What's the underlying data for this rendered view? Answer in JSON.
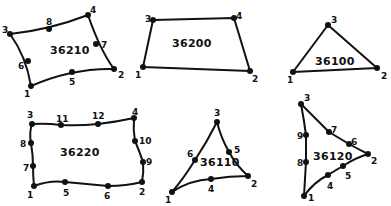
{
  "diagram": {
    "title": "",
    "elements": [
      {
        "id": "36210",
        "label": "36210",
        "shape": "quadrilateral-8-node",
        "label_pos": [
          50,
          54
        ],
        "path": "M31,86 Q72,68 114,69 Q100,50 88,15 Q49,30 10,34 Q26,56 31,86 Z",
        "nodes": [
          {
            "n": "1",
            "x": 31,
            "y": 86,
            "lx": 24,
            "ly": 97
          },
          {
            "n": "2",
            "x": 114,
            "y": 69,
            "lx": 118,
            "ly": 78
          },
          {
            "n": "3",
            "x": 10,
            "y": 34,
            "lx": 2,
            "ly": 33
          },
          {
            "n": "4",
            "x": 88,
            "y": 15,
            "lx": 90,
            "ly": 13
          },
          {
            "n": "5",
            "x": 72,
            "y": 72,
            "lx": 69,
            "ly": 85
          },
          {
            "n": "6",
            "x": 28,
            "y": 61,
            "lx": 18,
            "ly": 69
          },
          {
            "n": "7",
            "x": 96,
            "y": 44,
            "lx": 101,
            "ly": 48
          },
          {
            "n": "8",
            "x": 49,
            "y": 29,
            "lx": 46,
            "ly": 25
          }
        ]
      },
      {
        "id": "36200",
        "label": "36200",
        "shape": "quadrilateral-4-node",
        "label_pos": [
          172,
          47
        ],
        "path": "M143,67 L250,71 L234,18 L153,20 Z",
        "nodes": [
          {
            "n": "1",
            "x": 143,
            "y": 67,
            "lx": 135,
            "ly": 78
          },
          {
            "n": "2",
            "x": 250,
            "y": 71,
            "lx": 252,
            "ly": 82
          },
          {
            "n": "3",
            "x": 153,
            "y": 20,
            "lx": 145,
            "ly": 22
          },
          {
            "n": "4",
            "x": 234,
            "y": 18,
            "lx": 236,
            "ly": 19
          }
        ]
      },
      {
        "id": "36100",
        "label": "36100",
        "shape": "triangle-3-node",
        "label_pos": [
          315,
          65
        ],
        "path": "M293,72 L377,68 L328,25 Z",
        "nodes": [
          {
            "n": "1",
            "x": 293,
            "y": 72,
            "lx": 287,
            "ly": 83
          },
          {
            "n": "2",
            "x": 377,
            "y": 68,
            "lx": 381,
            "ly": 79
          },
          {
            "n": "3",
            "x": 328,
            "y": 25,
            "lx": 331,
            "ly": 23
          }
        ]
      },
      {
        "id": "36220",
        "label": "36220",
        "shape": "quadrilateral-12-node",
        "label_pos": [
          60,
          156
        ],
        "path": "M34,186 Q50,180 65,182 Q86,184 108,186 Q126,186 142,182 Q144,172 143,162 Q139,150 135,141 Q133,130 134,118 Q116,122 98,124 Q80,126 61,125 Q46,123 32,124 Q29,133 31,143 Q33,155 33,166 Q33,176 34,186 Z",
        "nodes": [
          {
            "n": "1",
            "x": 34,
            "y": 186,
            "lx": 27,
            "ly": 198
          },
          {
            "n": "2",
            "x": 142,
            "y": 182,
            "lx": 139,
            "ly": 195
          },
          {
            "n": "3",
            "x": 32,
            "y": 124,
            "lx": 27,
            "ly": 118
          },
          {
            "n": "4",
            "x": 134,
            "y": 118,
            "lx": 132,
            "ly": 115
          },
          {
            "n": "5",
            "x": 65,
            "y": 182,
            "lx": 63,
            "ly": 196
          },
          {
            "n": "6",
            "x": 108,
            "y": 186,
            "lx": 104,
            "ly": 199
          },
          {
            "n": "7",
            "x": 33,
            "y": 166,
            "lx": 23,
            "ly": 171
          },
          {
            "n": "8",
            "x": 31,
            "y": 143,
            "lx": 20,
            "ly": 147
          },
          {
            "n": "9",
            "x": 143,
            "y": 162,
            "lx": 146,
            "ly": 165
          },
          {
            "n": "10",
            "x": 135,
            "y": 141,
            "lx": 139,
            "ly": 144
          },
          {
            "n": "11",
            "x": 61,
            "y": 125,
            "lx": 56,
            "ly": 122
          },
          {
            "n": "12",
            "x": 98,
            "y": 124,
            "lx": 92,
            "ly": 119
          }
        ]
      },
      {
        "id": "36110",
        "label": "36110",
        "shape": "triangle-6-node",
        "label_pos": [
          200,
          166
        ],
        "path": "M172,192 Q190,180 211,179 Q230,176 248,176 Q236,165 229,152 Q221,138 217,122 Q207,142 195,160 Q184,178 172,192 Z",
        "nodes": [
          {
            "n": "1",
            "x": 172,
            "y": 192,
            "lx": 165,
            "ly": 203
          },
          {
            "n": "2",
            "x": 248,
            "y": 176,
            "lx": 251,
            "ly": 187
          },
          {
            "n": "3",
            "x": 217,
            "y": 122,
            "lx": 214,
            "ly": 116
          },
          {
            "n": "4",
            "x": 211,
            "y": 179,
            "lx": 208,
            "ly": 192
          },
          {
            "n": "5",
            "x": 229,
            "y": 152,
            "lx": 234,
            "ly": 153
          },
          {
            "n": "6",
            "x": 195,
            "y": 160,
            "lx": 187,
            "ly": 157
          }
        ]
      },
      {
        "id": "36120",
        "label": "36120",
        "shape": "triangle-9-node",
        "label_pos": [
          313,
          160
        ],
        "path": "M304,196 Q314,182 328,175 Q336,170 343,166 Q355,158 368,154 Q358,149 349,144 Q339,138 329,132 Q315,118 301,104 Q304,120 306,135 Q306,148 306,162 Q305,180 304,196 Z",
        "nodes": [
          {
            "n": "1",
            "x": 304,
            "y": 196,
            "lx": 308,
            "ly": 201
          },
          {
            "n": "2",
            "x": 368,
            "y": 154,
            "lx": 371,
            "ly": 164
          },
          {
            "n": "3",
            "x": 301,
            "y": 104,
            "lx": 304,
            "ly": 101
          },
          {
            "n": "4",
            "x": 328,
            "y": 175,
            "lx": 327,
            "ly": 189
          },
          {
            "n": "5",
            "x": 343,
            "y": 166,
            "lx": 345,
            "ly": 179
          },
          {
            "n": "6",
            "x": 349,
            "y": 144,
            "lx": 351,
            "ly": 145
          },
          {
            "n": "7",
            "x": 329,
            "y": 132,
            "lx": 331,
            "ly": 133
          },
          {
            "n": "8",
            "x": 306,
            "y": 162,
            "lx": 297,
            "ly": 166
          },
          {
            "n": "9",
            "x": 306,
            "y": 135,
            "lx": 297,
            "ly": 139
          }
        ]
      }
    ]
  }
}
